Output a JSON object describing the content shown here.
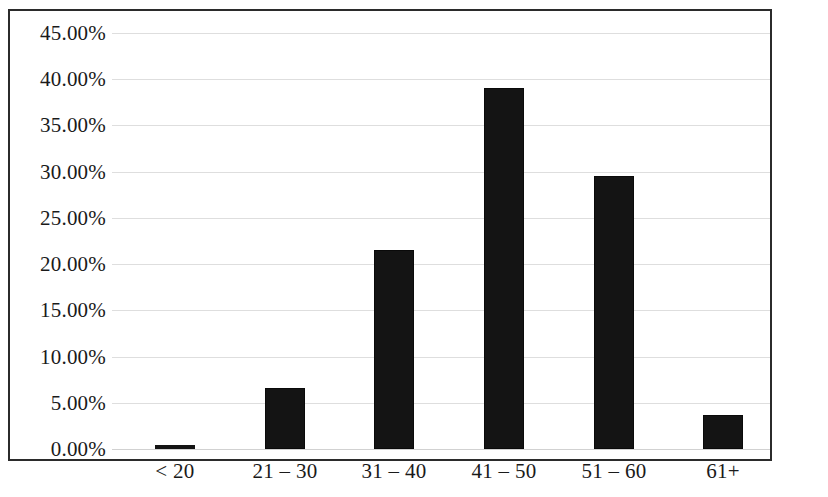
{
  "chart_data": {
    "type": "bar",
    "title": "",
    "subtitle": "",
    "xlabel": "",
    "ylabel": "",
    "categories": [
      "< 20",
      "21 – 30",
      "31 – 40",
      "41 – 50",
      "51 – 60",
      "61+"
    ],
    "values": [
      0.4,
      6.6,
      21.5,
      39.1,
      29.5,
      3.7
    ],
    "value_labels": [
      "0.40%",
      "6.60%",
      "21.50%",
      "39.10%",
      "29.50%",
      "3.70%"
    ],
    "ylim": [
      0,
      45
    ],
    "ytick_values": [
      45,
      40,
      35,
      30,
      25,
      20,
      15,
      10,
      5,
      0
    ],
    "ytick_labels": [
      "45.00%",
      "40.00%",
      "35.00%",
      "30.00%",
      "25.00%",
      "20.00%",
      "15.00%",
      "10.00%",
      "5.00%",
      "0.00%"
    ],
    "grid": true,
    "grid_axis": "y",
    "legend": false,
    "legend_position": "none",
    "series": [
      {
        "name": "Share of respondents",
        "values": [
          0.4,
          6.6,
          21.5,
          39.1,
          29.5,
          3.7
        ]
      }
    ],
    "annotations": []
  },
  "style": {
    "bar_color": "#141414",
    "bar_border_color": "#0a0a0a",
    "gridline_color": "#d8d8d8",
    "frame_color": "#2b2b2b",
    "text_color": "#1a1a1a",
    "background": "#ffffff"
  }
}
